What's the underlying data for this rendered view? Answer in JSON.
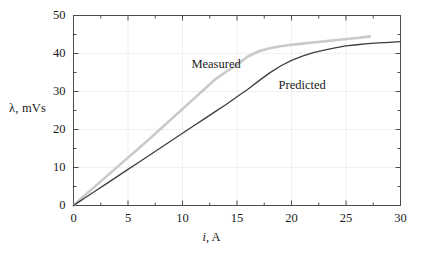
{
  "chart_data": {
    "type": "line",
    "title": "",
    "xlabel": "i, A",
    "xlabel_italic_part": "i",
    "xlabel_rest": ", A",
    "ylabel": "λ, mVs",
    "ylabel_symbol": "λ",
    "ylabel_rest": ", mVs",
    "xlim": [
      0,
      30
    ],
    "ylim": [
      0,
      50
    ],
    "xticks": [
      0,
      5,
      10,
      15,
      20,
      25,
      30
    ],
    "yticks": [
      0,
      10,
      20,
      30,
      40,
      50
    ],
    "xtick_labels": [
      "0",
      "5",
      "10",
      "15",
      "20",
      "25",
      "30"
    ],
    "ytick_labels": [
      "0",
      "10",
      "20",
      "30",
      "40",
      "50"
    ],
    "x_minor_step": 2.5,
    "y_minor_step": 5,
    "grid": true,
    "grid_color": "#f0f0f0",
    "axis_color": "#4d4d4d",
    "legend": "inline-annotations",
    "series": [
      {
        "name": "Measured",
        "color": "#c9c9c9",
        "width": 2.6,
        "label_x": 11.0,
        "label_y": 37.0,
        "x": [
          0,
          0.5,
          1,
          2,
          3,
          4,
          5,
          6,
          7,
          8,
          9,
          10,
          11,
          12,
          13,
          14,
          15,
          16,
          17,
          18,
          19,
          20,
          21,
          22,
          23,
          24,
          25,
          26,
          27.2
        ],
        "y": [
          0,
          1.3,
          2.6,
          5.1,
          7.6,
          10.1,
          12.6,
          15.1,
          17.6,
          20.2,
          22.8,
          25.4,
          28.0,
          30.6,
          33.2,
          35.2,
          37.0,
          39.2,
          40.6,
          41.4,
          41.9,
          42.3,
          42.6,
          42.9,
          43.2,
          43.5,
          43.8,
          44.1,
          44.5
        ]
      },
      {
        "name": "Predicted",
        "color": "#3d3d3d",
        "width": 1.3,
        "label_x": 19.0,
        "label_y": 31.5,
        "x": [
          0,
          0.5,
          1,
          2,
          3,
          4,
          5,
          6,
          7,
          8,
          9,
          10,
          11,
          12,
          13,
          14,
          15,
          16,
          17,
          18,
          19,
          20,
          21,
          22,
          23,
          24,
          25,
          26,
          27,
          28,
          29,
          30
        ],
        "y": [
          0,
          0.95,
          1.9,
          3.8,
          5.7,
          7.6,
          9.5,
          11.4,
          13.3,
          15.2,
          17.1,
          19.0,
          20.9,
          22.8,
          24.7,
          26.6,
          28.6,
          30.6,
          32.8,
          34.9,
          36.7,
          38.2,
          39.3,
          40.2,
          40.9,
          41.5,
          42.0,
          42.3,
          42.6,
          42.8,
          42.95,
          43.1
        ]
      }
    ]
  },
  "annotations": {
    "measured_label": "Measured",
    "predicted_label": "Predicted"
  }
}
